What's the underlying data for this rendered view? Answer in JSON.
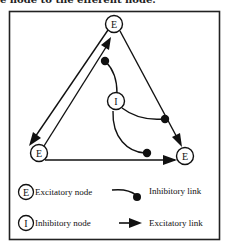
{
  "caption": "e node to the efferent node.",
  "diagram": {
    "nodes": [
      {
        "id": "top",
        "label": "E",
        "type": "excitatory"
      },
      {
        "id": "bottom-left",
        "label": "E",
        "type": "excitatory"
      },
      {
        "id": "bottom-right",
        "label": "E",
        "type": "excitatory"
      },
      {
        "id": "center",
        "label": "I",
        "type": "inhibitory"
      }
    ],
    "links": [
      {
        "from": "top",
        "to": "bottom-left",
        "type": "excitatory"
      },
      {
        "from": "bottom-left",
        "to": "top",
        "type": "excitatory"
      },
      {
        "from": "top",
        "to": "bottom-right",
        "type": "excitatory"
      },
      {
        "from": "bottom-left",
        "to": "bottom-right",
        "type": "excitatory"
      },
      {
        "from": "center",
        "to": "link:bottom-left->top",
        "type": "inhibitory"
      },
      {
        "from": "center",
        "to": "link:top->bottom-right",
        "type": "inhibitory"
      },
      {
        "from": "center",
        "to": "link:bottom-left->bottom-right",
        "type": "inhibitory"
      }
    ]
  },
  "legend": {
    "excitatory_node_symbol": "E",
    "excitatory_node_label": "Excitatory node",
    "inhibitory_node_symbol": "I",
    "inhibitory_node_label": "Inhibitory node",
    "inhibitory_link_label": "Inhibitory link",
    "excitatory_link_label": "Excitatory link"
  }
}
